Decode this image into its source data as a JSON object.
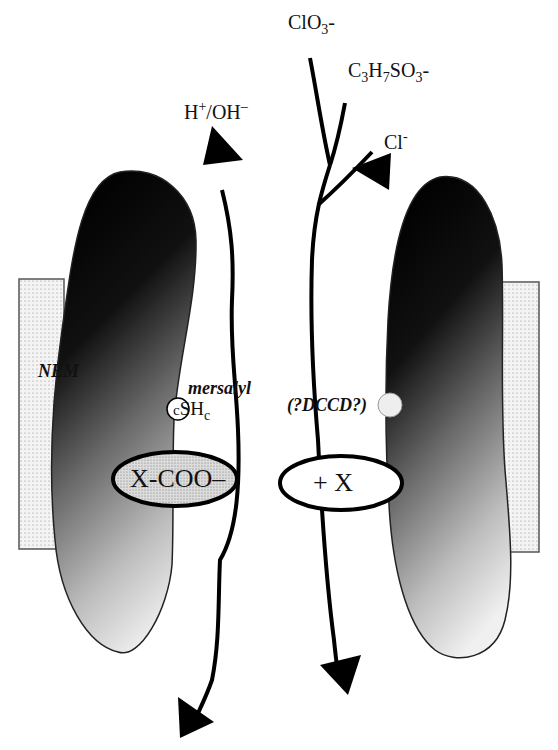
{
  "diagram": {
    "ions": {
      "chlorate": {
        "base": "ClO",
        "sub": "3",
        "charge": "-"
      },
      "propanesulfonate": {
        "part1": "C",
        "sub1": "3",
        "part2": "H",
        "sub2": "7",
        "part3": "SO",
        "sub3": "3",
        "charge": "-"
      },
      "chloride": {
        "base": "Cl",
        "charge": "-"
      },
      "proton": {
        "base": "H",
        "sup": "+",
        "rest": "/OH",
        "charge": "–"
      }
    },
    "labels": {
      "nem": "NEM",
      "mersalyl": "mersalyl",
      "dccd": "(?DCCD?)",
      "sh_prefix": "c",
      "sh": "SH",
      "sh_sub": "c"
    },
    "sites": {
      "carboxylate": "X-COO–",
      "cationic": "+ X"
    },
    "colors": {
      "ink": "#000000",
      "membrane_fill": "#f2f2f2",
      "protein_dark": "#0a0a0a",
      "protein_light": "#e6e6e6",
      "carboxyl_fill": "#d0d0d0"
    }
  }
}
